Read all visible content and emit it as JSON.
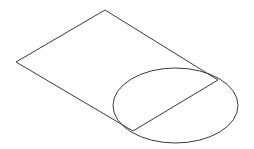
{
  "figure": {
    "stroke_color": "#3a3a3a",
    "background": "#ffffff",
    "parallelogram": {
      "top": [
        105,
        10
      ],
      "left": [
        16,
        62
      ],
      "bottom_right": [
        133,
        131
      ],
      "top_right": [
        218,
        80
      ]
    },
    "ellipse": {
      "cx": 175.5,
      "cy": 105.5,
      "rx": 62.5,
      "ry": 37.5
    },
    "chord": {
      "from": [
        218,
        80
      ],
      "to": [
        133,
        131
      ]
    }
  }
}
